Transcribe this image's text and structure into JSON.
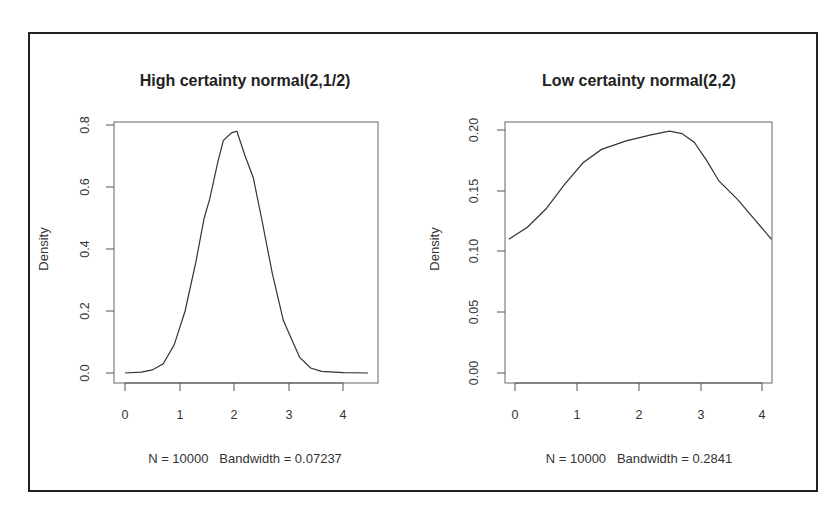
{
  "chart_data": [
    {
      "type": "line",
      "title": "High certainty normal(2,1/2)",
      "xlabel": "N = 10000   Bandwidth = 0.07237",
      "ylabel": "Density",
      "xticks": [
        "0",
        "1",
        "2",
        "3",
        "4"
      ],
      "yticks": [
        "0.0",
        "0.2",
        "0.4",
        "0.6",
        "0.8"
      ],
      "xlim": [
        0,
        4.45
      ],
      "ylim": [
        0,
        0.8
      ],
      "grid": false,
      "x": [
        0,
        0.3,
        0.5,
        0.7,
        0.9,
        1.1,
        1.3,
        1.45,
        1.55,
        1.7,
        1.8,
        1.95,
        2.05,
        2.2,
        2.35,
        2.5,
        2.7,
        2.9,
        3.05,
        3.2,
        3.4,
        3.6,
        4.0,
        4.45
      ],
      "y": [
        0.0,
        0.003,
        0.01,
        0.03,
        0.09,
        0.2,
        0.36,
        0.5,
        0.56,
        0.68,
        0.75,
        0.775,
        0.78,
        0.7,
        0.63,
        0.5,
        0.32,
        0.17,
        0.11,
        0.05,
        0.016,
        0.005,
        0.001,
        0.0
      ]
    },
    {
      "type": "line",
      "title": "Low certainty normal(2,2)",
      "xlabel": "N = 10000   Bandwidth = 0.2841",
      "ylabel": "Density",
      "xticks": [
        "0",
        "1",
        "2",
        "3",
        "4"
      ],
      "yticks": [
        "0.00",
        "0.05",
        "0.10",
        "0.15",
        "0.20"
      ],
      "xlim": [
        -0.1,
        4.15
      ],
      "ylim": [
        0,
        0.2
      ],
      "grid": false,
      "x": [
        -0.1,
        0.2,
        0.5,
        0.8,
        1.1,
        1.4,
        1.8,
        2.2,
        2.5,
        2.7,
        2.9,
        3.1,
        3.3,
        3.6,
        3.9,
        4.15
      ],
      "y": [
        0.11,
        0.12,
        0.135,
        0.155,
        0.173,
        0.184,
        0.191,
        0.196,
        0.199,
        0.197,
        0.19,
        0.175,
        0.158,
        0.143,
        0.125,
        0.11
      ]
    }
  ],
  "colors": {
    "line": "#333333",
    "frame": "#222222",
    "axis": "#555555"
  }
}
